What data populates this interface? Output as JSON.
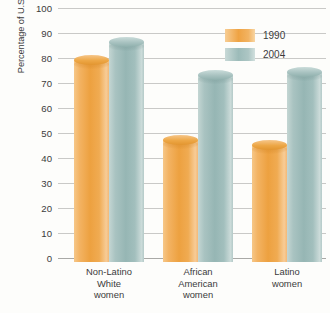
{
  "chart_data": {
    "type": "bar",
    "title": "",
    "xlabel": "",
    "ylabel": "Percentage of U.S. women using timely prenatal care",
    "ylim": [
      0,
      100
    ],
    "yticks": [
      0,
      10,
      20,
      30,
      40,
      50,
      60,
      70,
      80,
      90,
      100
    ],
    "grid": true,
    "legend_position": "top-right",
    "categories": [
      "Non-Latino White women",
      "African American women",
      "Latino women"
    ],
    "category_lines": [
      [
        "Non-Latino",
        "White",
        "women"
      ],
      [
        "African",
        "American",
        "women"
      ],
      [
        "Latino",
        "women"
      ]
    ],
    "series": [
      {
        "name": "1990",
        "color": "#EDA140",
        "values": [
          81,
          49,
          47
        ]
      },
      {
        "name": "2004",
        "color": "#9DBDBB",
        "values": [
          88,
          75,
          76
        ]
      }
    ]
  },
  "legend": {
    "items": [
      {
        "label": "1990",
        "color": "#EDA140"
      },
      {
        "label": "2004",
        "color": "#9DBDBB"
      }
    ]
  },
  "axis": {
    "y_title": "Percentage of U.S. women using timely prenatal care",
    "tick_labels": [
      "0",
      "10",
      "20",
      "30",
      "40",
      "50",
      "60",
      "70",
      "80",
      "90",
      "100"
    ]
  }
}
